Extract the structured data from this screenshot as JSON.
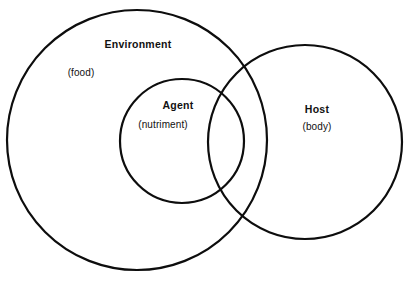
{
  "figure": {
    "type": "venn-diagram",
    "background_color": "#ffffff",
    "stroke_color": "#0d0d0d"
  },
  "sets": {
    "environment": {
      "title": "Environment",
      "subtitle": "(food)"
    },
    "agent": {
      "title": "Agent",
      "subtitle": "(nutriment)"
    },
    "host": {
      "title": "Host",
      "subtitle": "(body)"
    }
  },
  "chart_data": {
    "type": "venn",
    "title": "",
    "xlabel": "",
    "ylabel": "",
    "grid": false,
    "legend": "none",
    "circles": [
      {
        "name": "Environment",
        "label": "Environment",
        "sublabel": "(food)",
        "cx": 137,
        "cy": 140,
        "r": 130
      },
      {
        "name": "Agent",
        "label": "Agent",
        "sublabel": "(nutriment)",
        "cx": 182,
        "cy": 141,
        "r": 62
      },
      {
        "name": "Host",
        "label": "Host",
        "sublabel": "(body)",
        "cx": 305,
        "cy": 142,
        "r": 97
      }
    ],
    "relations": [
      "Agent is fully contained within Environment",
      "Host overlaps Environment",
      "Host overlaps Agent"
    ]
  }
}
